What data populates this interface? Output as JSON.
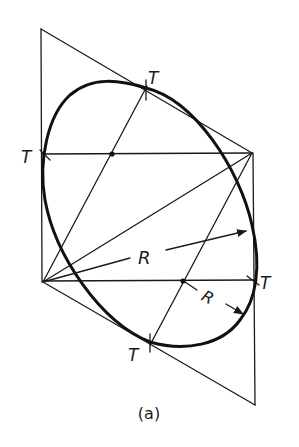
{
  "figure": {
    "caption": "(a)",
    "labels": {
      "tangent_top": "T",
      "tangent_left": "T",
      "tangent_right": "T",
      "tangent_bottom": "T",
      "radius_large": "R",
      "radius_small": "R"
    },
    "colors": {
      "line": "#1a1a1a",
      "background": "#ffffff"
    }
  }
}
